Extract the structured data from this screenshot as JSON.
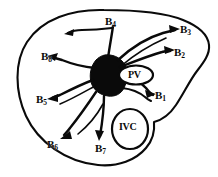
{
  "figure": {
    "background_color": "#ffffff",
    "ink_color": "#0a0a0a"
  },
  "segments": [
    {
      "id": "b4",
      "label": "B",
      "subscript": "4",
      "x": 105,
      "y": 16
    },
    {
      "id": "b3",
      "label": "B",
      "subscript": "3",
      "x": 180,
      "y": 24
    },
    {
      "id": "b2",
      "label": "B",
      "subscript": "2",
      "x": 174,
      "y": 47
    },
    {
      "id": "b8",
      "label": "B",
      "subscript": "8",
      "x": 41,
      "y": 51
    },
    {
      "id": "b5",
      "label": "B",
      "subscript": "5",
      "x": 36,
      "y": 94
    },
    {
      "id": "b1",
      "label": "B",
      "subscript": "1",
      "x": 155,
      "y": 90
    },
    {
      "id": "b6",
      "label": "B",
      "subscript": "6",
      "x": 47,
      "y": 139
    },
    {
      "id": "b7",
      "label": "B",
      "subscript": "7",
      "x": 95,
      "y": 143
    }
  ],
  "vessels": [
    {
      "id": "pv",
      "label": "PV",
      "x": 128,
      "y": 70
    },
    {
      "id": "ivc",
      "label": "IVC",
      "x": 119,
      "y": 122
    }
  ]
}
